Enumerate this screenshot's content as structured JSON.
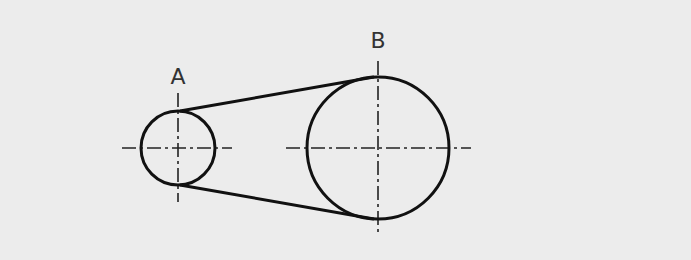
{
  "diagram": {
    "background": "#ececec",
    "stroke": "#111111",
    "centerline_color": "#222222",
    "pulleys": [
      {
        "label": "A",
        "cx": 178,
        "cy": 148,
        "r": 37
      },
      {
        "label": "B",
        "cx": 378,
        "cy": 148,
        "r": 72
      }
    ],
    "belt": {
      "upper": {
        "x1": 178,
        "y1": 111,
        "x2": 378,
        "y2": 77
      },
      "lower": {
        "x1": 178,
        "y1": 185,
        "x2": 378,
        "y2": 219
      }
    }
  }
}
